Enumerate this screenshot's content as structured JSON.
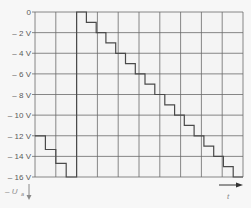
{
  "chart_data": {
    "type": "line",
    "subtype": "staircase-sawtooth",
    "title": "",
    "xlabel": "t",
    "ylabel": "-U_a",
    "ylabel_main": "– U",
    "ylabel_sub": "a",
    "ylim": [
      -16,
      0
    ],
    "yticks": [
      0,
      -2,
      -4,
      -6,
      -8,
      -10,
      -12,
      -14,
      -16
    ],
    "ytick_labels": [
      "0",
      "– 2 V",
      "– 4 V",
      "– 6 V",
      "– 8 V",
      "– 10 V",
      "– 12 V",
      "– 14 V",
      "– 16 V"
    ],
    "x_divisions": 10,
    "grid": true,
    "x_axis_arrow": true,
    "y_axis_arrow": "down",
    "series": [
      {
        "name": "U_a staircase",
        "segments": [
          {
            "x_start": 0.0,
            "x_end": 0.5,
            "y": -12
          },
          {
            "x_start": 0.5,
            "x_end": 1.0,
            "y": -13.33
          },
          {
            "x_start": 1.0,
            "x_end": 1.5,
            "y": -14.67
          },
          {
            "x_start": 1.5,
            "x_end": 2.0,
            "y": -16
          },
          {
            "x_start": 2.0,
            "x_end": 2.47,
            "y": 0
          },
          {
            "x_start": 2.47,
            "x_end": 2.94,
            "y": -1
          },
          {
            "x_start": 2.94,
            "x_end": 3.41,
            "y": -2
          },
          {
            "x_start": 3.41,
            "x_end": 3.88,
            "y": -3
          },
          {
            "x_start": 3.88,
            "x_end": 4.35,
            "y": -4
          },
          {
            "x_start": 4.35,
            "x_end": 4.82,
            "y": -5
          },
          {
            "x_start": 4.82,
            "x_end": 5.29,
            "y": -6
          },
          {
            "x_start": 5.29,
            "x_end": 5.76,
            "y": -7
          },
          {
            "x_start": 5.76,
            "x_end": 6.24,
            "y": -8
          },
          {
            "x_start": 6.24,
            "x_end": 6.71,
            "y": -9
          },
          {
            "x_start": 6.71,
            "x_end": 7.18,
            "y": -10
          },
          {
            "x_start": 7.18,
            "x_end": 7.65,
            "y": -11
          },
          {
            "x_start": 7.65,
            "x_end": 8.12,
            "y": -12
          },
          {
            "x_start": 8.12,
            "x_end": 8.59,
            "y": -13
          },
          {
            "x_start": 8.59,
            "x_end": 9.06,
            "y": -14
          },
          {
            "x_start": 9.06,
            "x_end": 9.53,
            "y": -15
          },
          {
            "x_start": 9.53,
            "x_end": 10.0,
            "y": -16
          }
        ]
      }
    ]
  },
  "colors": {
    "background": "#f7f7f7",
    "plot_background": "#f4f4f4",
    "grid": "#6a6a6a",
    "trace": "#4a4a4a",
    "tick_text": "#5a5a5a",
    "axis_label": "#8a8a8a"
  }
}
